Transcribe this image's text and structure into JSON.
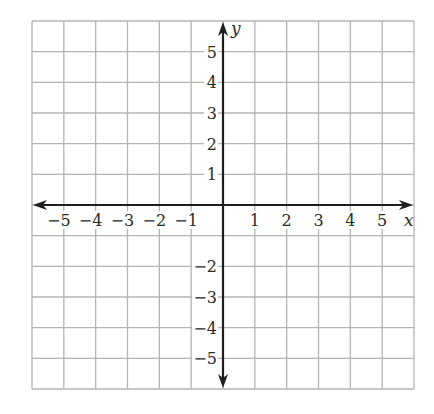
{
  "chart_data": {
    "type": "coordinate-grid",
    "title": "",
    "xlabel": "x",
    "ylabel": "y",
    "xlim": [
      -6,
      6
    ],
    "ylim": [
      -6,
      6
    ],
    "grid": true,
    "grid_step": 1,
    "x_tick_labels": [
      "−5",
      "−4",
      "−3",
      "−2",
      "−1",
      "1",
      "2",
      "3",
      "4",
      "5"
    ],
    "x_tick_values": [
      -5,
      -4,
      -3,
      -2,
      -1,
      1,
      2,
      3,
      4,
      5
    ],
    "y_tick_labels": [
      "5",
      "4",
      "3",
      "2",
      "1",
      "−2",
      "−3",
      "−4",
      "−5"
    ],
    "y_tick_values": [
      5,
      4,
      3,
      2,
      1,
      -2,
      -3,
      -4,
      -5
    ],
    "axes_arrows": true,
    "series": []
  },
  "colors": {
    "grid": "#b4b4b4",
    "axis": "#1e1e1e",
    "text": "#2a2a2a",
    "background": "#ffffff"
  },
  "layout": {
    "left": 32,
    "top": 21,
    "right": 414,
    "bottom": 389,
    "cells_x": 12,
    "cells_y": 12
  }
}
